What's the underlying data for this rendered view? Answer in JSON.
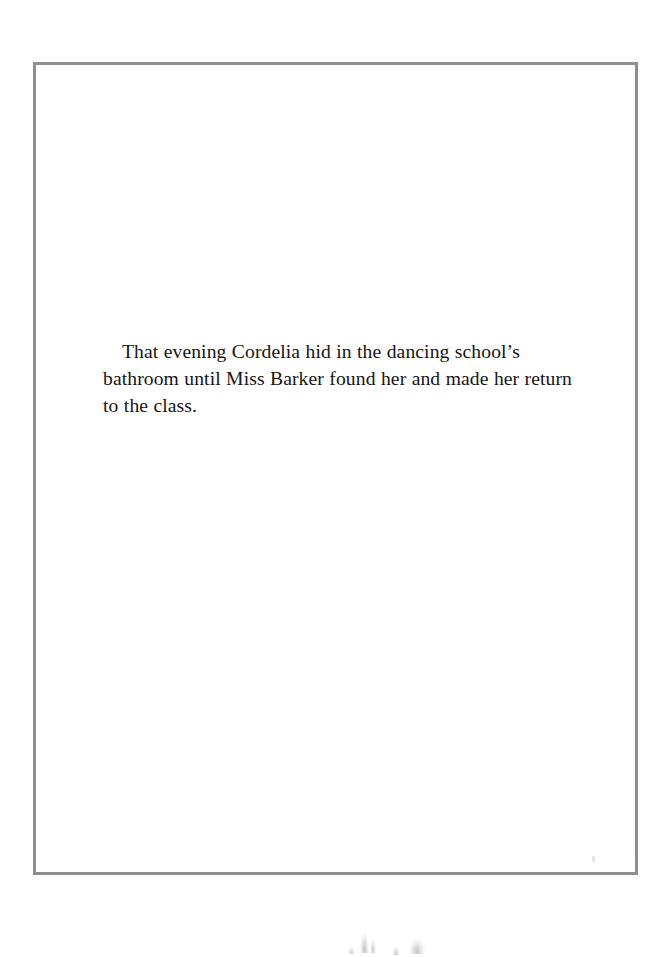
{
  "page": {
    "kind": "scanned-book-page",
    "background_color": "#fefefe",
    "width": 656,
    "height": 957
  },
  "frame": {
    "name": "decorative-rule-border",
    "color": "#8d8f92",
    "thickness_px": 3,
    "left": 33,
    "top": 62,
    "width": 605,
    "height": 813
  },
  "body": {
    "paragraph": "That evening Cordelia hid in the dancing school’s bathroom until Miss Barker found her and made her return to the class.",
    "text_color": "#151515",
    "font_size_px": 19.6,
    "line_height_px": 27.2,
    "first_line_indent_px": 19,
    "lines": [
      "That evening Cordelia hid in the dancing school’s",
      "bathroom until Miss Barker found her and made her",
      "return to the class."
    ]
  },
  "artifacts": {
    "description": "faint ink bleed-through marks along bottom edge",
    "count": 5
  }
}
